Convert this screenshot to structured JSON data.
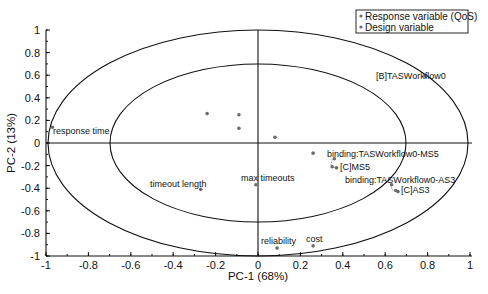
{
  "chart_data": {
    "type": "scatter",
    "title": "",
    "xlabel": "PC-1 (68%)",
    "ylabel": "PC-2 (13%)",
    "xlim": [
      -1,
      1
    ],
    "ylim": [
      -1,
      1
    ],
    "xticks": [
      "-1",
      "-0.8",
      "-0.6",
      "-0.4",
      "-0.2",
      "0",
      "0.2",
      "0.4",
      "0.6",
      "0.8",
      "1"
    ],
    "yticks": [
      "1",
      "0.8",
      "0.6",
      "0.4",
      "0.2",
      "0",
      "-0.2",
      "-0.4",
      "-0.6",
      "-0.8",
      "-1"
    ],
    "grid": false,
    "ellipses": [
      {
        "name": "outer",
        "rx": 1.0,
        "ry": 1.0
      },
      {
        "name": "inner",
        "rx": 0.7,
        "ry": 0.7
      }
    ],
    "legend": {
      "position": "top-right",
      "entries": [
        {
          "label": "Response variable (QoS)",
          "marker": "dot"
        },
        {
          "label": "Design variable",
          "marker": "dot"
        }
      ]
    },
    "series": [
      {
        "name": "Response variable (QoS)",
        "points": [
          {
            "label": "response time",
            "x": -0.97,
            "y": 0.14
          },
          {
            "label": "reliability",
            "x": 0.09,
            "y": -0.93
          },
          {
            "label": "cost",
            "x": 0.26,
            "y": -0.91
          }
        ]
      },
      {
        "name": "Design variable",
        "points": [
          {
            "label": "[B]TASWorkflow0",
            "x": 0.79,
            "y": 0.59
          },
          {
            "label": "timeout length",
            "x": -0.27,
            "y": -0.41
          },
          {
            "label": "max timeouts",
            "x": -0.01,
            "y": -0.37
          },
          {
            "label": "binding:TASWorkflow0-MS5",
            "x": 0.26,
            "y": -0.09
          },
          {
            "label": "[C]MS5",
            "x": 0.36,
            "y": -0.14
          },
          {
            "label": "",
            "x": 0.35,
            "y": -0.21
          },
          {
            "label": "",
            "x": 0.37,
            "y": -0.22
          },
          {
            "label": "binding:TASWorkflow0-AS3",
            "x": 0.63,
            "y": -0.37
          },
          {
            "label": "[C]AS3",
            "x": 0.65,
            "y": -0.42
          },
          {
            "label": "",
            "x": 0.66,
            "y": -0.43
          },
          {
            "label": "",
            "x": -0.24,
            "y": 0.26
          },
          {
            "label": "",
            "x": -0.09,
            "y": 0.25
          },
          {
            "label": "",
            "x": -0.09,
            "y": 0.13
          },
          {
            "label": "",
            "x": 0.08,
            "y": 0.05
          }
        ]
      }
    ]
  },
  "labels": {
    "xlabel": "PC-1 (68%)",
    "ylabel": "PC-2 (13%)",
    "legend_response": "Response variable (QoS)",
    "legend_design": "Design variable",
    "response_time": "response time",
    "reliability": "reliability",
    "cost": "cost",
    "b_workflow": "[B]TASWorkflow0",
    "timeout_length": "timeout length",
    "max_timeouts": "max timeouts",
    "binding_ms5": "binding:TASWorkflow0-MS5",
    "c_ms5": "[C]MS5",
    "binding_as3": "binding:TASWorkflow0-AS3",
    "c_as3": "[C]AS3"
  },
  "colors": {
    "axis": "#111111",
    "marker": "#6b6b6b",
    "ellipse": "#111111"
  }
}
